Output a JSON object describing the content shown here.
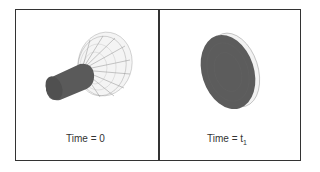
{
  "figure": {
    "panels": [
      {
        "id": "panel-left",
        "caption": "Time = 0",
        "shape": "cylinder-with-disc-wireframe"
      },
      {
        "id": "panel-right",
        "caption_main": "Time = t",
        "caption_sub": "1",
        "shape": "flattened-disc"
      }
    ],
    "colors": {
      "border": "#333333",
      "solid": "#5a5a5a",
      "wire": "#888888",
      "text": "#333333"
    }
  }
}
